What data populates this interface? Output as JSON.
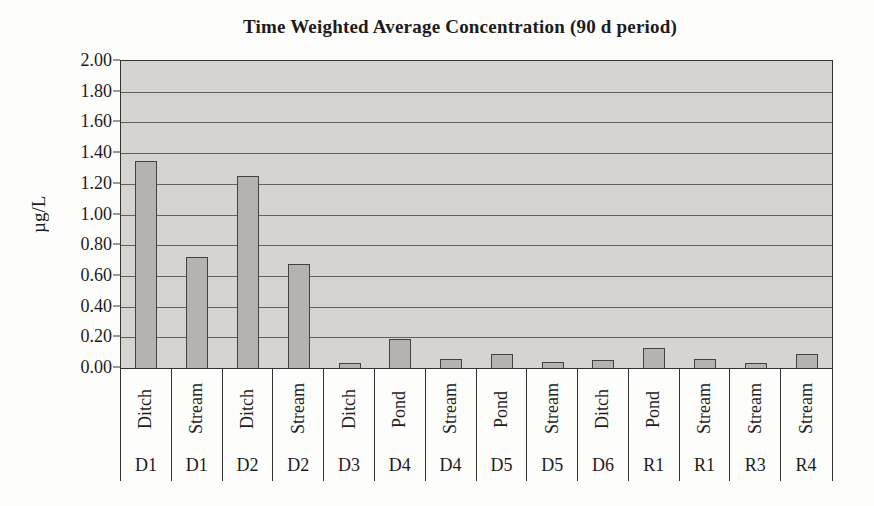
{
  "chart_data": {
    "type": "bar",
    "title": "Time Weighted Average Concentration (90 d period)",
    "xlabel": "",
    "ylabel": "µg/L",
    "ylim": [
      0,
      2.0
    ],
    "ytick_step": 0.2,
    "yticks": [
      "2.00",
      "1.80",
      "1.60",
      "1.40",
      "1.20",
      "1.00",
      "0.80",
      "0.60",
      "0.40",
      "0.20",
      "0.00"
    ],
    "grid": true,
    "legend": false,
    "categories_top": [
      "Ditch",
      "Stream",
      "Ditch",
      "Stream",
      "Ditch",
      "Pond",
      "Stream",
      "Pond",
      "Stream",
      "Ditch",
      "Pond",
      "Stream",
      "Stream",
      "Stream"
    ],
    "categories_bottom": [
      "D1",
      "D1",
      "D2",
      "D2",
      "D3",
      "D4",
      "D4",
      "D5",
      "D5",
      "D6",
      "R1",
      "R1",
      "R3",
      "R4"
    ],
    "values": [
      1.35,
      0.72,
      1.25,
      0.68,
      0.03,
      0.19,
      0.06,
      0.09,
      0.04,
      0.05,
      0.13,
      0.06,
      0.03,
      0.09
    ],
    "colors": {
      "plot_bg": "#d5d4d2",
      "bar_fill": "#b4b3b1",
      "bar_border": "#44423e",
      "gridline": "#4e4c48",
      "axis": "#343434",
      "text": "#1e1c1a"
    }
  }
}
